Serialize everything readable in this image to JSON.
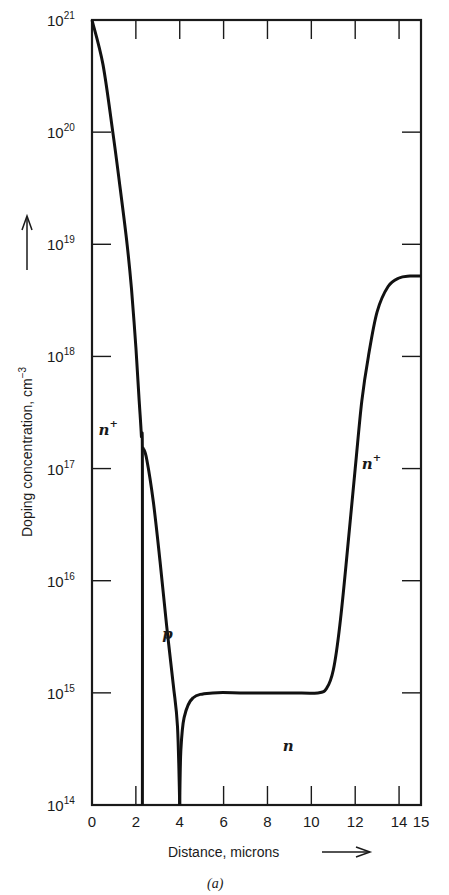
{
  "chart_data": {
    "type": "line",
    "title": "",
    "caption": "(a)",
    "xlabel": "Distance, microns",
    "ylabel": "Doping concentration, cm",
    "ylabel_superscript": "−3",
    "xlim": [
      0,
      15
    ],
    "ylim": [
      100000000000000.0,
      1e+21
    ],
    "yscale": "log",
    "grid": false,
    "x_ticks": [
      0,
      2,
      4,
      6,
      8,
      10,
      12,
      14,
      15
    ],
    "x_tick_labels": [
      "0",
      "2",
      "4",
      "6",
      "8",
      "10",
      "12",
      "14",
      "15"
    ],
    "y_ticks": [
      14,
      15,
      16,
      17,
      18,
      19,
      20,
      21
    ],
    "y_tick_labels": [
      "10^14",
      "10^15",
      "10^16",
      "10^17",
      "10^18",
      "10^19",
      "10^20",
      "10^21"
    ],
    "series": [
      {
        "name": "n+ emitter",
        "x": [
          0,
          0.5,
          0.95,
          1.3,
          1.6,
          1.8,
          2.0,
          2.15,
          2.25,
          2.3,
          2.3
        ],
        "y": [
          1e+21,
          4e+20,
          1e+20,
          3e+19,
          1e+19,
          4e+18,
          1.2e+18,
          4e+17,
          2e+17,
          1e+17,
          100000000000000.0
        ]
      },
      {
        "name": "p base",
        "x": [
          2.3,
          2.35,
          2.5,
          2.8,
          3.1,
          3.4,
          3.7,
          3.9,
          4.0
        ],
        "y": [
          1.5e+17,
          1.5e+17,
          1.2e+17,
          5e+16,
          1.5e+16,
          4000000000000000.0,
          1200000000000000.0,
          500000000000000.0,
          100000000000000.0
        ]
      },
      {
        "name": "n collector / n+ substrate",
        "x": [
          4.0,
          4.05,
          4.2,
          4.6,
          5.5,
          7,
          9,
          10.3,
          10.7,
          11.0,
          11.3,
          11.6,
          12.0,
          12.3,
          12.6,
          13.0,
          13.5,
          14.0,
          14.5,
          15.0
        ],
        "y": [
          100000000000000.0,
          300000000000000.0,
          600000000000000.0,
          900000000000000.0,
          1000000000000000.0,
          1000000000000000.0,
          1000000000000000.0,
          1000000000000000.0,
          1100000000000000.0,
          1600000000000000.0,
          4000000000000000.0,
          1.5e+16,
          1e+17,
          4e+17,
          1e+18,
          2.5e+18,
          4.2e+18,
          5e+18,
          5.2e+18,
          5.2e+18
        ]
      }
    ],
    "annotations": [
      {
        "text": "n+",
        "x": 0.3,
        "y": 2e+17
      },
      {
        "text": "p",
        "x": 3.2,
        "y": 3000000000000000.0
      },
      {
        "text": "n",
        "x": 8.7,
        "y": 300000000000000.0
      },
      {
        "text": "n+",
        "x": 12.3,
        "y": 1e+17
      }
    ]
  },
  "labels": {
    "xlabel": "Distance, microns",
    "ylabel": "Doping concentration, cm",
    "ylabel_sup": "−3",
    "caption": "(a)",
    "y_base": "10"
  }
}
